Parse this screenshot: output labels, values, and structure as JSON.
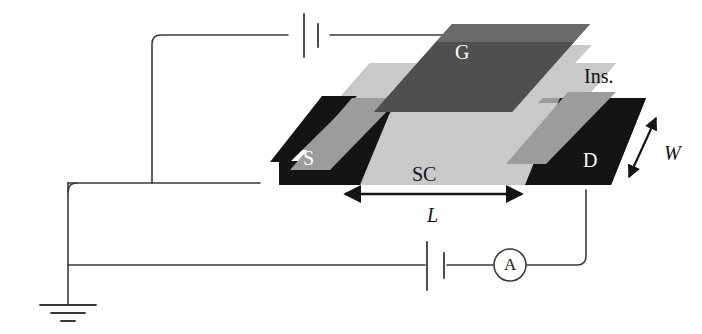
{
  "figure": {
    "type": "isometric-device-schematic",
    "canvas": {
      "width": 702,
      "height": 334,
      "background": "#ffffff"
    }
  },
  "palette": {
    "electrode_black": "#141414",
    "gate_dark_gray": "#4f4f4f",
    "insulator_mid_gray": "#9c9c9c",
    "semiconductor_light_gray": "#c9c9c9",
    "wire_line": "#3a3a3a",
    "label_white": "#ffffff",
    "label_black": "#141414",
    "background": "#ffffff"
  },
  "device": {
    "layers": [
      {
        "key": "source",
        "label": "S",
        "color": "#141414",
        "role": "source-electrode"
      },
      {
        "key": "drain",
        "label": "D",
        "color": "#141414",
        "role": "drain-electrode"
      },
      {
        "key": "semiconductor",
        "label": "SC",
        "color": "#c9c9c9",
        "role": "semiconductor-channel"
      },
      {
        "key": "insulator",
        "label": "Ins.",
        "color": "#9c9c9c",
        "role": "gate-insulator"
      },
      {
        "key": "gate",
        "label": "G",
        "color": "#4f4f4f",
        "role": "gate-electrode"
      }
    ]
  },
  "labels": {
    "gate": "G",
    "source": "S",
    "drain": "D",
    "semiconductor": "SC",
    "insulator": "Ins.",
    "channel_length": "L",
    "channel_width": "W",
    "ammeter": "A"
  },
  "dimensions": [
    {
      "symbol": "L",
      "name": "channel-length",
      "arrow": "double-headed",
      "orientation": "horizontal"
    },
    {
      "symbol": "W",
      "name": "channel-width",
      "arrow": "double-headed",
      "orientation": "diagonal"
    }
  ],
  "circuit": {
    "elements": [
      {
        "key": "gate_battery",
        "name": "gate-bias-battery",
        "symbol": "battery",
        "branch": "gate"
      },
      {
        "key": "drain_battery",
        "name": "drain-bias-battery",
        "symbol": "battery",
        "branch": "drain-source"
      },
      {
        "key": "ammeter",
        "name": "ammeter",
        "symbol": "circle-A",
        "label": "A",
        "branch": "drain-source"
      },
      {
        "key": "ground",
        "name": "ground",
        "symbol": "earth-ground",
        "bars": 3
      }
    ],
    "nets": [
      {
        "from": "ground",
        "to": "gate_battery",
        "via": "left-rail"
      },
      {
        "from": "gate_battery",
        "to": "gate",
        "via": "top-rail"
      },
      {
        "from": "ground",
        "to": "source",
        "via": "mid-rail"
      },
      {
        "from": "ground",
        "to": "drain_battery",
        "via": "bottom-rail"
      },
      {
        "from": "drain_battery",
        "to": "ammeter",
        "via": "bottom-rail"
      },
      {
        "from": "ammeter",
        "to": "drain",
        "via": "right-riser"
      }
    ]
  }
}
